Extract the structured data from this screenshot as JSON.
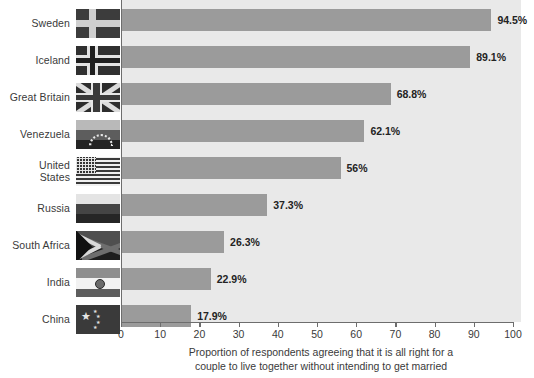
{
  "chart_data": {
    "type": "bar",
    "orientation": "horizontal",
    "title": "",
    "xlabel": "Proportion of respondents agreeing that it is all right for a couple to live together without intending to get married",
    "xlabel_lines": [
      "Proportion of respondents agreeing that it is all right for a",
      "couple to live together without intending to get married"
    ],
    "ylabel": "",
    "categories": [
      "Sweden",
      "Iceland",
      "Great Britain",
      "Venezuela",
      "United States",
      "Russia",
      "South Africa",
      "India",
      "China"
    ],
    "values": [
      94.5,
      89.1,
      68.8,
      62.1,
      56,
      37.3,
      26.3,
      22.9,
      17.9
    ],
    "data_labels": [
      "94.5%",
      "89.1%",
      "68.8%",
      "62.1%",
      "56%",
      "37.3%",
      "26.3%",
      "22.9%",
      "17.9%"
    ],
    "xlim": [
      0,
      100
    ],
    "xticks": [
      0,
      10,
      20,
      30,
      40,
      50,
      60,
      70,
      80,
      90,
      100
    ],
    "xtick_labels": [
      "0",
      "10",
      "20",
      "30",
      "40",
      "50",
      "60",
      "70",
      "80",
      "90",
      "100"
    ],
    "grid": false,
    "legend": null,
    "bar_color": "#9b9b9b",
    "plot_background": "#e9e9e9",
    "axis_color": "#6d6d6d"
  },
  "rows": [
    {
      "label": "Sweden",
      "label_display": "Sweden",
      "value": 94.5,
      "data_label": "94.5%",
      "flag": "sweden-flag"
    },
    {
      "label": "Iceland",
      "label_display": "Iceland",
      "value": 89.1,
      "data_label": "89.1%",
      "flag": "iceland-flag"
    },
    {
      "label": "Great Britain",
      "label_display": "Great Britain",
      "value": 68.8,
      "data_label": "68.8%",
      "flag": "great-britain-flag"
    },
    {
      "label": "Venezuela",
      "label_display": "Venezuela",
      "value": 62.1,
      "data_label": "62.1%",
      "flag": "venezuela-flag"
    },
    {
      "label": "United States",
      "label_display": "United\nStates",
      "value": 56,
      "data_label": "56%",
      "flag": "united-states-flag"
    },
    {
      "label": "Russia",
      "label_display": "Russia",
      "value": 37.3,
      "data_label": "37.3%",
      "flag": "russia-flag"
    },
    {
      "label": "South Africa",
      "label_display": "South Africa",
      "value": 26.3,
      "data_label": "26.3%",
      "flag": "south-africa-flag"
    },
    {
      "label": "India",
      "label_display": "India",
      "value": 22.9,
      "data_label": "22.9%",
      "flag": "india-flag"
    },
    {
      "label": "China",
      "label_display": "China",
      "value": 17.9,
      "data_label": "17.9%",
      "flag": "china-flag"
    }
  ]
}
